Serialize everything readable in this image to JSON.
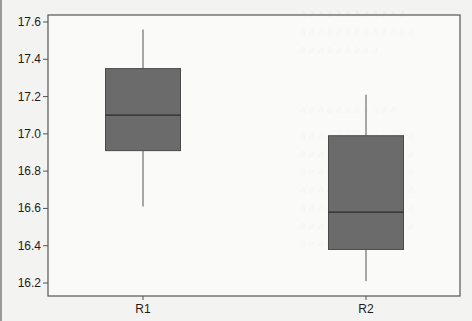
{
  "chart_data": {
    "type": "box",
    "title": "",
    "xlabel": "",
    "ylabel": "",
    "categories": [
      "R1",
      "R2"
    ],
    "ylim": [
      16.15,
      17.65
    ],
    "yticks": [
      16.2,
      16.4,
      16.6,
      16.8,
      17.0,
      17.2,
      17.4,
      17.6
    ],
    "ytick_labels": [
      "16.2",
      "16.4",
      "16.6",
      "16.8",
      "17.0",
      "17.2",
      "17.4",
      "17.6"
    ],
    "grid": false,
    "legend": null,
    "series": [
      {
        "name": "R1",
        "whisker_low": 16.61,
        "q1": 16.91,
        "median": 17.1,
        "q3": 17.35,
        "whisker_high": 17.56
      },
      {
        "name": "R2",
        "whisker_low": 16.21,
        "q1": 16.38,
        "median": 16.58,
        "q3": 16.99,
        "whisker_high": 17.21
      }
    ],
    "colors": {
      "box_fill": "#6b6b6b",
      "box_edge": "#4a4a4a",
      "median": "#2a2a2a",
      "whisker": "#555555",
      "axis": "#555555"
    }
  }
}
